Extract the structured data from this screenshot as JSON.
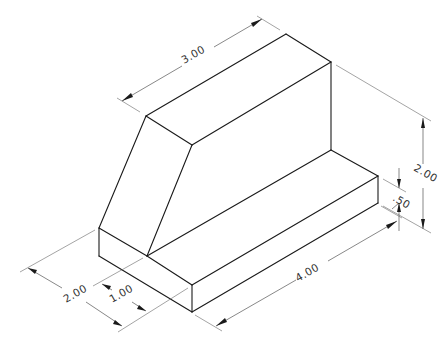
{
  "drawing": {
    "type": "isometric-technical-drawing",
    "subject": "L-shaped block with sloped face",
    "line_color": "#1a1a1a",
    "dimension_color": "#555555",
    "background": "#ffffff"
  },
  "dimensions": {
    "top_length": {
      "label": "3.00"
    },
    "overall_height": {
      "label": "2.00"
    },
    "step_height": {
      "label": ".50"
    },
    "overall_length": {
      "label": "4.00"
    },
    "overall_depth": {
      "label": "2.00"
    },
    "step_depth": {
      "label": "1.00"
    }
  }
}
